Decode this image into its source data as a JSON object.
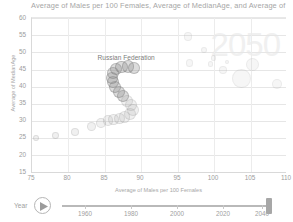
{
  "chart_title": "Average of Males per 100 Females, Average of MedianAge, and Average of",
  "watermark_year": "2050",
  "axis": {
    "y_title": "Average of MedianAge",
    "x_title": "Average of Males per 100 Females",
    "y_ticks": [
      "60",
      "55",
      "50",
      "45",
      "40",
      "35",
      "30",
      "25",
      "20",
      "15"
    ],
    "x_ticks": [
      "75",
      "80",
      "85",
      "90",
      "95",
      "100",
      "105",
      "110"
    ],
    "ylim": [
      15,
      60
    ],
    "xlim": [
      75,
      110
    ]
  },
  "series_label": "Russian Federation",
  "slider": {
    "label": "Year",
    "play_icon": "play-icon",
    "ticks": [
      "1960",
      "1980",
      "2000",
      "2020",
      "2040"
    ],
    "value": "2050"
  },
  "chart_data": {
    "type": "scatter",
    "title": "Average of Males per 100 Females, Average of MedianAge, and Average of",
    "xlabel": "Average of Males per 100 Females",
    "ylabel": "Average of MedianAge",
    "xlim": [
      75,
      110
    ],
    "ylim": [
      15,
      60
    ],
    "grid": true,
    "legend": false,
    "annotations": [
      {
        "text": "Russian Federation",
        "x": 87.3,
        "y": 48.0
      },
      {
        "text": "2050",
        "x": 103.5,
        "y": 52.0,
        "role": "watermark"
      }
    ],
    "series": [
      {
        "name": "Russian Federation trail",
        "points": [
          {
            "x": 75.6,
            "y": 25.2,
            "r": 3.0
          },
          {
            "x": 78.2,
            "y": 25.8,
            "r": 3.4
          },
          {
            "x": 80.9,
            "y": 27.0,
            "r": 4.0
          },
          {
            "x": 83.2,
            "y": 28.6,
            "r": 4.6
          },
          {
            "x": 84.5,
            "y": 29.6,
            "r": 5.0
          },
          {
            "x": 85.4,
            "y": 30.2,
            "r": 5.2
          },
          {
            "x": 86.2,
            "y": 30.6,
            "r": 5.4
          },
          {
            "x": 87.0,
            "y": 30.9,
            "r": 5.6
          },
          {
            "x": 87.7,
            "y": 31.3,
            "r": 5.8
          },
          {
            "x": 88.4,
            "y": 32.0,
            "r": 6.0
          },
          {
            "x": 88.8,
            "y": 33.2,
            "r": 6.0
          },
          {
            "x": 88.6,
            "y": 34.6,
            "r": 6.0
          },
          {
            "x": 88.1,
            "y": 36.0,
            "r": 6.0
          },
          {
            "x": 87.5,
            "y": 37.3,
            "r": 6.0
          },
          {
            "x": 86.9,
            "y": 38.6,
            "r": 6.0
          },
          {
            "x": 86.4,
            "y": 40.0,
            "r": 6.0
          },
          {
            "x": 86.1,
            "y": 41.4,
            "r": 6.0
          },
          {
            "x": 86.0,
            "y": 42.7,
            "r": 6.0
          },
          {
            "x": 86.1,
            "y": 44.0,
            "r": 6.0
          },
          {
            "x": 86.5,
            "y": 45.1,
            "r": 6.0
          },
          {
            "x": 87.3,
            "y": 45.8,
            "r": 6.2
          },
          {
            "x": 88.2,
            "y": 45.9,
            "r": 6.2
          },
          {
            "x": 89.0,
            "y": 45.5,
            "r": 6.0
          }
        ]
      },
      {
        "name": "Other countries",
        "points": [
          {
            "x": 96.4,
            "y": 54.6,
            "r": 4.4
          },
          {
            "x": 98.6,
            "y": 50.6,
            "r": 3.0
          },
          {
            "x": 99.9,
            "y": 48.4,
            "r": 2.6
          },
          {
            "x": 96.6,
            "y": 47.0,
            "r": 3.8
          },
          {
            "x": 99.5,
            "y": 46.6,
            "r": 2.8
          },
          {
            "x": 101.8,
            "y": 47.2,
            "r": 2.2
          },
          {
            "x": 101.2,
            "y": 44.8,
            "r": 4.0
          },
          {
            "x": 105.3,
            "y": 46.6,
            "r": 6.6
          },
          {
            "x": 103.8,
            "y": 42.4,
            "r": 9.4
          },
          {
            "x": 108.6,
            "y": 40.8,
            "r": 5.0
          }
        ]
      }
    ]
  }
}
